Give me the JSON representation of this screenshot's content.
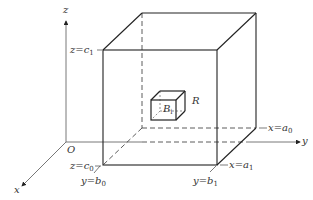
{
  "figure": {
    "axes": {
      "x_label": "x",
      "y_label": "y",
      "z_label": "z",
      "origin_label": "O"
    },
    "bounds": {
      "z_c1": {
        "var": "z",
        "eq": "=",
        "sym": "c",
        "sub": "1"
      },
      "z_c0": {
        "var": "z",
        "eq": "=",
        "sym": "c",
        "sub": "0"
      },
      "y_b0": {
        "var": "y",
        "eq": "=",
        "sym": "b",
        "sub": "0"
      },
      "y_b1": {
        "var": "y",
        "eq": "=",
        "sym": "b",
        "sub": "1"
      },
      "x_a0": {
        "var": "x",
        "eq": "=",
        "sym": "a",
        "sub": "0"
      },
      "x_a1": {
        "var": "x",
        "eq": "=",
        "sym": "a",
        "sub": "1"
      }
    },
    "region_label": "R",
    "subbox_label": {
      "sym": "B",
      "sub": "i"
    },
    "colors": {
      "line": "#222222",
      "axis": "#444444",
      "text": "#333333",
      "background": "#ffffff"
    }
  }
}
